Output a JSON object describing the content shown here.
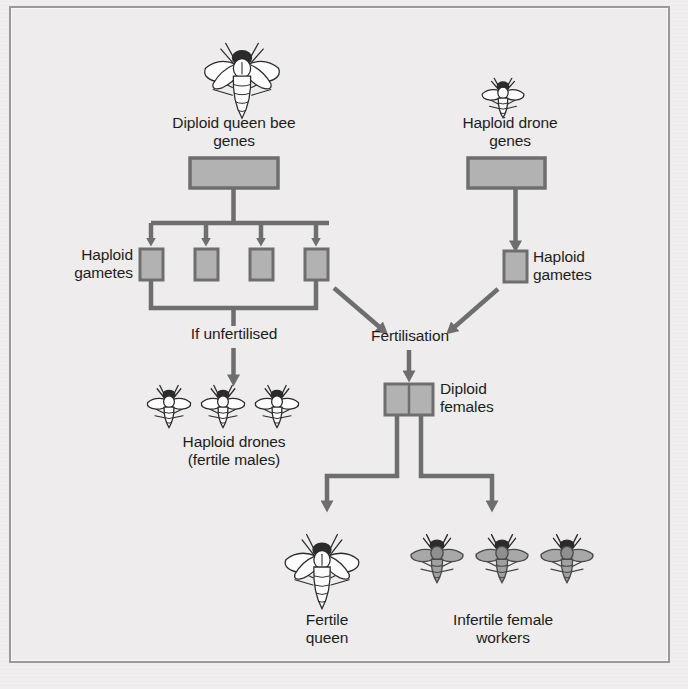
{
  "figure": {
    "background_color": "#eeecec",
    "box_fill": "#b2b2b2",
    "box_stroke": "#6e6e6e",
    "line_color": "#6e6e6e",
    "text_color": "#1d1d1d"
  },
  "labels": {
    "queen_genes": "Diploid queen bee\ngenes",
    "drone_genes": "Haploid drone\ngenes",
    "haploid_gametes_left": "Haploid\ngametes",
    "haploid_gametes_right": "Haploid\ngametes",
    "if_unfertilised": "If unfertilised",
    "fertilisation": "Fertilisation",
    "diploid_females": "Diploid\nfemales",
    "haploid_drones": "Haploid drones\n(fertile males)",
    "fertile_queen": "Fertile\nqueen",
    "infertile_workers": "Infertile female\nworkers"
  },
  "nodes": {
    "queen_gene_box": {
      "x": 188,
      "y": 157,
      "w": 88,
      "h": 30,
      "ploidy": "diploid"
    },
    "drone_gene_box": {
      "x": 466,
      "y": 157,
      "w": 77,
      "h": 30,
      "ploidy": "haploid"
    },
    "queen_gamete_boxes": [
      {
        "x": 138,
        "y": 248,
        "w": 24,
        "h": 30
      },
      {
        "x": 193,
        "y": 248,
        "w": 24,
        "h": 30
      },
      {
        "x": 248,
        "y": 248,
        "w": 24,
        "h": 30
      },
      {
        "x": 303,
        "y": 248,
        "w": 24,
        "h": 30
      }
    ],
    "drone_gamete_box": {
      "x": 490,
      "y": 250,
      "w": 24,
      "h": 30
    },
    "diploid_female_box": {
      "x": 382,
      "y": 383,
      "w": 48,
      "h": 30,
      "halves": 2
    }
  },
  "bees": {
    "queen_top": {
      "x": 196,
      "y": 28,
      "scale": 1.0,
      "kind": "queen",
      "fill": "#fbfbfb"
    },
    "drone_top": {
      "x": 485,
      "y": 70,
      "scale": 0.52,
      "kind": "drone",
      "fill": "#fbfbfb"
    },
    "haploid_drones": [
      {
        "x": 151,
        "y": 385,
        "scale": 0.54,
        "kind": "drone",
        "fill": "#fcfcfc"
      },
      {
        "x": 205,
        "y": 385,
        "scale": 0.54,
        "kind": "drone",
        "fill": "#fcfcfc"
      },
      {
        "x": 259,
        "y": 385,
        "scale": 0.54,
        "kind": "drone",
        "fill": "#fcfcfc"
      }
    ],
    "fertile_queen": {
      "x": 278,
      "y": 525,
      "scale": 0.92,
      "kind": "queen",
      "fill": "#fbfbfb"
    },
    "infertile_workers": [
      {
        "x": 413,
        "y": 533,
        "scale": 0.6,
        "kind": "worker",
        "fill": "#9b9b9b"
      },
      {
        "x": 478,
        "y": 533,
        "scale": 0.6,
        "kind": "worker",
        "fill": "#9b9b9b"
      },
      {
        "x": 543,
        "y": 533,
        "scale": 0.6,
        "kind": "worker",
        "fill": "#9b9b9b"
      }
    ]
  },
  "ghost_text": [
    {
      "x": 120,
      "y": 14,
      "text": "mi thx mt ht u  qucm bcc nd thc mui"
    },
    {
      "x": 60,
      "y": 40,
      "text": "cthwi mi ncncl lhc mnd nd hthc mlcd"
    },
    {
      "x": 54,
      "y": 64,
      "text": "thc mnc mhnc nt l m d c c ncn c"
    },
    {
      "x": 60,
      "y": 88,
      "text": "thc mnc mucn hcc nd thc mnlc tm"
    },
    {
      "x": 70,
      "y": 140,
      "text": "ncnth nt h thc mucn lh thcn mn"
    },
    {
      "x": 58,
      "y": 166,
      "text": "cll h h tc mh lc hcc n tlc mn"
    },
    {
      "x": 62,
      "y": 192,
      "text": "hmtnc thc mlc hcc"
    },
    {
      "x": 220,
      "y": 275,
      "text": "Why  c mlc hcc nlctlc"
    },
    {
      "x": 48,
      "y": 306,
      "text": "Whc c mutcd n hhc ndhdul  nc"
    },
    {
      "x": 40,
      "y": 332,
      "text": "hl mlc hcc n thc hcc  cm n ht"
    },
    {
      "x": 44,
      "y": 356,
      "text": "thc c c c mnc thcc  thc mlc hcc"
    },
    {
      "x": 48,
      "y": 384,
      "text": "h hnc ncmn mc thn thc hcc"
    },
    {
      "x": 48,
      "y": 412,
      "text": "nd l c lnc  thc mlc hcc  mcth"
    },
    {
      "x": 42,
      "y": 440,
      "text": "hlc mnc  lncl n hc n mlc hcc"
    },
    {
      "x": 44,
      "y": 470,
      "text": "thc hcc  c thcc  thc mlc nd hcc"
    },
    {
      "x": 44,
      "y": 500,
      "text": "nlctlc  l c mc ln thc nt"
    },
    {
      "x": 44,
      "y": 530,
      "text": "hc mlc hcc nlc tlc  thc thn lnc"
    },
    {
      "x": 46,
      "y": 558,
      "text": "nc nlc thc thn thc hcc mlc hcc"
    },
    {
      "x": 46,
      "y": 584,
      "text": "c thcc nc hcc thc nlc mlc hcc"
    }
  ]
}
